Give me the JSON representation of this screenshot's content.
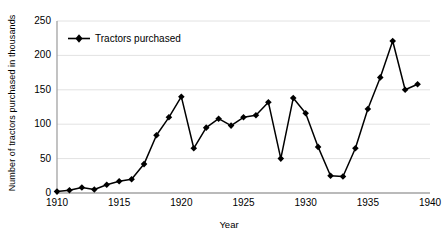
{
  "chart_data": {
    "type": "line",
    "title": "",
    "xlabel": "Year",
    "ylabel": "Number of tractors purchased in thousands",
    "xlim": [
      1910,
      1940
    ],
    "ylim": [
      0,
      250
    ],
    "grid": true,
    "legend_position": "top-left",
    "x_ticks": [
      "1910",
      "1915",
      "1920",
      "1925",
      "1930",
      "1935",
      "1940"
    ],
    "y_ticks": [
      "0",
      "50",
      "100",
      "150",
      "200",
      "250"
    ],
    "series": [
      {
        "name": "Tractors purchased",
        "color": "#000000",
        "marker": "diamond",
        "x": [
          1910,
          1911,
          1912,
          1913,
          1914,
          1915,
          1916,
          1917,
          1918,
          1919,
          1920,
          1921,
          1922,
          1923,
          1924,
          1925,
          1926,
          1927,
          1928,
          1929,
          1930,
          1931,
          1932,
          1933,
          1934,
          1935,
          1936,
          1937,
          1938,
          1939
        ],
        "values": [
          2,
          4,
          8,
          5,
          12,
          17,
          20,
          42,
          84,
          110,
          140,
          65,
          95,
          108,
          98,
          110,
          113,
          132,
          50,
          138,
          116,
          67,
          25,
          24,
          65,
          122,
          168,
          221,
          150,
          158
        ]
      }
    ]
  },
  "legend": {
    "entries": [
      {
        "label": "Tractors purchased"
      }
    ]
  },
  "axes": {
    "x_title": "Year",
    "y_title": "Number of tractors purchased in thousands"
  }
}
